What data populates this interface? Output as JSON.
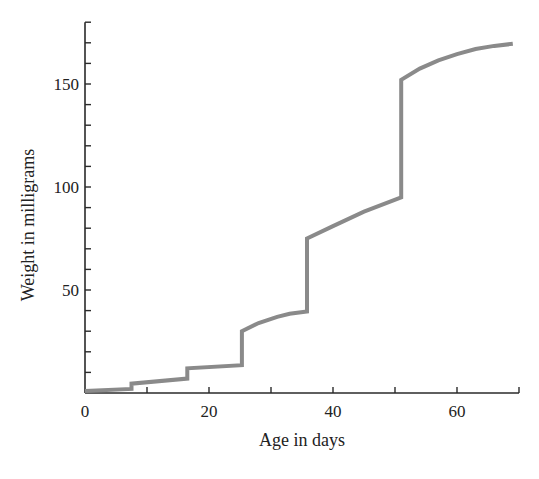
{
  "chart_data": {
    "type": "line",
    "title": "",
    "xlabel": "Age in days",
    "ylabel": "Weight in milligrams",
    "xlim": [
      0,
      70
    ],
    "ylim": [
      0,
      180
    ],
    "x_ticks": [
      0,
      10,
      20,
      30,
      40,
      50,
      60,
      70
    ],
    "x_tick_labels": [
      "0",
      "20",
      "40",
      "60"
    ],
    "x_tick_label_values": [
      0,
      20,
      40,
      60
    ],
    "y_ticks": [
      10,
      20,
      30,
      40,
      50,
      60,
      70,
      80,
      90,
      100,
      110,
      120,
      130,
      140,
      150,
      160,
      170,
      180
    ],
    "y_tick_labels": [
      "50",
      "100",
      "150"
    ],
    "y_tick_label_values": [
      50,
      100,
      150
    ],
    "grid": false,
    "legend": null,
    "line_color": "#8a8a8a",
    "axis_color": "#2a2a2a",
    "series": [
      {
        "name": "Weight",
        "x": [
          0,
          7.5,
          7.5,
          16.5,
          16.5,
          25.3,
          25.3,
          28,
          31,
          33,
          35.8,
          35.8,
          40,
          45,
          51,
          51,
          54,
          57,
          60,
          63,
          66,
          69
        ],
        "y": [
          1,
          2,
          4.5,
          7,
          12,
          13.5,
          30,
          34,
          37,
          38.5,
          39.5,
          75,
          81,
          88,
          95,
          152,
          157.5,
          161.5,
          164.5,
          167,
          168.5,
          169.5
        ]
      }
    ]
  }
}
